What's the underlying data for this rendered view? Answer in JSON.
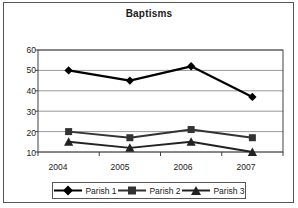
{
  "chart_data": {
    "type": "line",
    "title": "Baptisms",
    "xlabel": "",
    "ylabel": "",
    "categories": [
      "2004",
      "2005",
      "2006",
      "2007"
    ],
    "series": [
      {
        "name": "Parish 1",
        "marker": "diamond",
        "color": "#000000",
        "values": [
          50,
          45,
          52,
          37
        ]
      },
      {
        "name": "Parish 2",
        "marker": "square",
        "color": "#333333",
        "values": [
          20,
          17,
          21,
          17
        ]
      },
      {
        "name": "Parish 3",
        "marker": "triangle",
        "color": "#222222",
        "values": [
          15,
          12,
          15,
          10
        ]
      }
    ],
    "ylim": [
      10,
      60
    ],
    "yticks": [
      10,
      20,
      30,
      40,
      50,
      60
    ],
    "ytick_labels": [
      "10",
      "20",
      "30",
      "40",
      "50",
      "60"
    ],
    "xtick_labels": [
      "2004",
      "2005",
      "2006",
      "2007"
    ],
    "grid": true,
    "grid_axis": "y",
    "legend_position": "bottom",
    "legend_entries": [
      "Parish 1",
      "Parish 2",
      "Parish 3"
    ]
  },
  "legend": {
    "items": [
      {
        "label": "Parish 1",
        "icon": "diamond-marker-icon"
      },
      {
        "label": "Parish 2",
        "icon": "square-marker-icon"
      },
      {
        "label": "Parish 3",
        "icon": "triangle-marker-icon"
      }
    ]
  },
  "axes": {
    "y_labels": [
      "60",
      "50",
      "40",
      "30",
      "20",
      "10"
    ],
    "x_labels": [
      "2004",
      "2005",
      "2006",
      "2007"
    ]
  },
  "colors": {
    "frame": "#555555",
    "gridline": "#808080",
    "axis": "#404040",
    "series_1": "#000000",
    "series_2": "#333333",
    "series_3": "#222222",
    "text": "#1a1a1a",
    "background": "#ffffff"
  }
}
